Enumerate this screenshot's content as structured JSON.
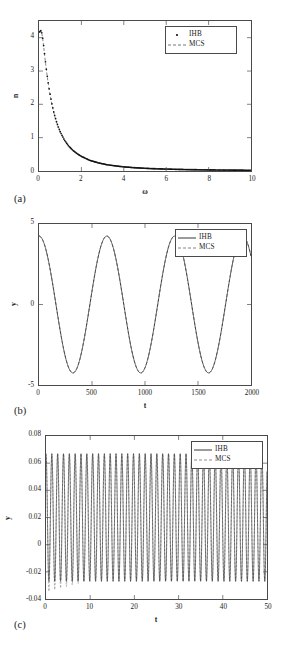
{
  "figure": {
    "panels": [
      "a",
      "b",
      "c"
    ],
    "label_a": "(a)",
    "label_b": "(b)",
    "label_c": "(c)",
    "colors": {
      "ihb": "#1a1a1a",
      "mcs": "#555555",
      "axis": "#4a4a4a",
      "background": "#ffffff"
    }
  },
  "chart_data": [
    {
      "type": "scatter",
      "panel": "(a)",
      "title": "",
      "xlabel": "ω",
      "ylabel": "n",
      "xlim": [
        0,
        10
      ],
      "ylim": [
        0,
        4.5
      ],
      "xticks": [
        0,
        2,
        4,
        6,
        8,
        10
      ],
      "xtick_labels": [
        "0",
        "2",
        "4",
        "6",
        "8",
        "10"
      ],
      "yticks": [
        0,
        1,
        2,
        3,
        4
      ],
      "ytick_labels": [
        "0",
        "1",
        "2",
        "3",
        "4"
      ],
      "grid": false,
      "legend_position": "top-right",
      "legend": [
        "IHB",
        "MCS"
      ],
      "series": [
        {
          "name": "IHB",
          "style": "dotted-markers",
          "marker": "dot",
          "x": [
            0.05,
            0.1,
            0.15,
            0.2,
            0.25,
            0.3,
            0.35,
            0.4,
            0.45,
            0.5,
            0.6,
            0.7,
            0.8,
            0.9,
            1.0,
            1.2,
            1.4,
            1.6,
            1.8,
            2.0,
            2.4,
            2.8,
            3.2,
            3.6,
            4.0,
            4.5,
            5.0,
            5.5,
            6.0,
            6.5,
            7.0,
            7.5,
            8.0,
            8.5,
            9.0,
            9.5,
            10.0
          ],
          "y": [
            4.18,
            4.22,
            4.1,
            3.86,
            3.58,
            3.3,
            3.04,
            2.8,
            2.58,
            2.38,
            2.04,
            1.76,
            1.53,
            1.34,
            1.18,
            0.93,
            0.75,
            0.62,
            0.52,
            0.44,
            0.32,
            0.245,
            0.19,
            0.155,
            0.125,
            0.1,
            0.082,
            0.068,
            0.058,
            0.05,
            0.043,
            0.038,
            0.033,
            0.03,
            0.027,
            0.024,
            0.022
          ]
        },
        {
          "name": "MCS",
          "style": "dashed-line",
          "x": [
            0.05,
            0.1,
            0.15,
            0.2,
            0.25,
            0.3,
            0.35,
            0.4,
            0.45,
            0.5,
            0.6,
            0.7,
            0.8,
            0.9,
            1.0,
            1.2,
            1.4,
            1.6,
            1.8,
            2.0,
            2.4,
            2.8,
            3.2,
            3.6,
            4.0,
            4.5,
            5.0,
            5.5,
            6.0,
            6.5,
            7.0,
            7.5,
            8.0,
            8.5,
            9.0,
            9.5,
            10.0
          ],
          "y": [
            4.16,
            4.2,
            4.08,
            3.84,
            3.56,
            3.28,
            3.02,
            2.78,
            2.56,
            2.36,
            2.02,
            1.74,
            1.51,
            1.32,
            1.16,
            0.91,
            0.74,
            0.61,
            0.51,
            0.43,
            0.315,
            0.24,
            0.187,
            0.152,
            0.123,
            0.098,
            0.08,
            0.066,
            0.056,
            0.049,
            0.042,
            0.037,
            0.032,
            0.029,
            0.026,
            0.023,
            0.021
          ]
        }
      ]
    },
    {
      "type": "line",
      "panel": "(b)",
      "title": "",
      "xlabel": "t",
      "ylabel": "y",
      "xlim": [
        0,
        2000
      ],
      "ylim": [
        -5,
        5
      ],
      "xticks": [
        0,
        500,
        1000,
        1500,
        2000
      ],
      "xtick_labels": [
        "0",
        "500",
        "1000",
        "1500",
        "2000"
      ],
      "yticks": [
        -5,
        0,
        5
      ],
      "ytick_labels": [
        "-5",
        "0",
        "5"
      ],
      "grid": false,
      "legend_position": "top-right",
      "legend": [
        "IHB",
        "MCS"
      ],
      "waveform": {
        "amplitude": 4.25,
        "period": 640,
        "phase_deg": 0,
        "shape": "cosine"
      },
      "series": [
        {
          "name": "IHB",
          "style": "solid-line"
        },
        {
          "name": "MCS",
          "style": "dashed-line"
        }
      ]
    },
    {
      "type": "line",
      "panel": "(c)",
      "title": "",
      "xlabel": "t",
      "ylabel": "y",
      "xlim": [
        0,
        50
      ],
      "ylim": [
        -0.04,
        0.08
      ],
      "xticks": [
        0,
        10,
        20,
        30,
        40,
        50
      ],
      "xtick_labels": [
        "0",
        "10",
        "20",
        "30",
        "40",
        "50"
      ],
      "yticks": [
        -0.04,
        -0.02,
        0,
        0.02,
        0.04,
        0.06,
        0.08
      ],
      "ytick_labels": [
        "-0.04",
        "-0.02",
        "0",
        "0.02",
        "0.04",
        "0.06",
        "0.08"
      ],
      "grid": false,
      "legend_position": "top-right",
      "legend": [
        "IHB",
        "MCS"
      ],
      "waveform": {
        "peak": 0.067,
        "trough": -0.027,
        "period": 1.32,
        "transient_trough": -0.035,
        "transient_end_t": 9
      },
      "series": [
        {
          "name": "IHB",
          "style": "solid-line"
        },
        {
          "name": "MCS",
          "style": "dashed-line"
        }
      ]
    }
  ]
}
